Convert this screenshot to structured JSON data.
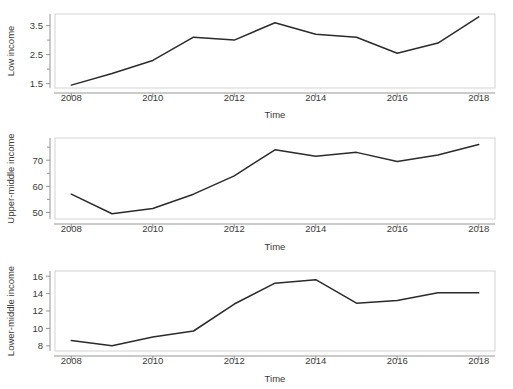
{
  "figure": {
    "width": 513,
    "height": 389,
    "background": "#ffffff",
    "line_color": "#2b2b2b",
    "axis_color": "#8a8a8a",
    "frame_color": "#c9c9c9",
    "text_color": "#3a3a3a"
  },
  "chart_data": [
    {
      "type": "line",
      "title": "",
      "xlabel": "Time",
      "ylabel": "Low income",
      "x": [
        2008,
        2009,
        2010,
        2011,
        2012,
        2013,
        2014,
        2015,
        2016,
        2017,
        2018
      ],
      "values": [
        1.45,
        1.85,
        2.3,
        3.1,
        3.0,
        3.6,
        3.2,
        3.1,
        2.55,
        2.9,
        3.8
      ],
      "series": [
        {
          "name": "Low income",
          "values": [
            1.45,
            1.85,
            2.3,
            3.1,
            3.0,
            3.6,
            3.2,
            3.1,
            2.55,
            2.9,
            3.8
          ]
        }
      ],
      "xlim": [
        2007.6,
        2018.4
      ],
      "ylim": [
        1.35,
        3.9
      ],
      "xticks": [
        2008,
        2010,
        2012,
        2014,
        2016,
        2018
      ],
      "xtick_labels": [
        "2008",
        "2010",
        "2012",
        "2014",
        "2016",
        "2018"
      ],
      "yticks": [
        1.5,
        2.5,
        3.5
      ],
      "ytick_labels": [
        "1.5",
        "2.5",
        "3.5"
      ],
      "yminor_ticks": [
        2.0,
        3.0
      ],
      "grid": false,
      "legend": false
    },
    {
      "type": "line",
      "title": "",
      "xlabel": "Time",
      "ylabel": "Upper-middle income",
      "x": [
        2008,
        2009,
        2010,
        2011,
        2012,
        2013,
        2014,
        2015,
        2016,
        2017,
        2018
      ],
      "values": [
        57.0,
        49.5,
        51.5,
        57.0,
        64.0,
        74.0,
        71.5,
        73.0,
        69.5,
        72.0,
        76.0
      ],
      "series": [
        {
          "name": "Upper-middle income",
          "values": [
            57.0,
            49.5,
            51.5,
            57.0,
            64.0,
            74.0,
            71.5,
            73.0,
            69.5,
            72.0,
            76.0
          ]
        }
      ],
      "xlim": [
        2007.6,
        2018.4
      ],
      "ylim": [
        47.5,
        78.5
      ],
      "xticks": [
        2008,
        2010,
        2012,
        2014,
        2016,
        2018
      ],
      "xtick_labels": [
        "2008",
        "2010",
        "2012",
        "2014",
        "2016",
        "2018"
      ],
      "yticks": [
        50,
        60,
        70
      ],
      "ytick_labels": [
        "50",
        "60",
        "70"
      ],
      "yminor_ticks": [
        55,
        65,
        75
      ],
      "grid": false,
      "legend": false
    },
    {
      "type": "line",
      "title": "",
      "xlabel": "Time",
      "ylabel": "Lower-middle income",
      "x": [
        2008,
        2009,
        2010,
        2011,
        2012,
        2013,
        2014,
        2015,
        2016,
        2017,
        2018
      ],
      "values": [
        8.6,
        8.0,
        9.0,
        9.7,
        12.8,
        15.2,
        15.6,
        12.9,
        13.2,
        14.1,
        14.1
      ],
      "series": [
        {
          "name": "Lower-middle income",
          "values": [
            8.6,
            8.0,
            9.0,
            9.7,
            12.8,
            15.2,
            15.6,
            12.9,
            13.2,
            14.1,
            14.1
          ]
        }
      ],
      "xlim": [
        2007.6,
        2018.4
      ],
      "ylim": [
        7.4,
        16.6
      ],
      "xticks": [
        2008,
        2010,
        2012,
        2014,
        2016,
        2018
      ],
      "xtick_labels": [
        "2008",
        "2010",
        "2012",
        "2014",
        "2016",
        "2018"
      ],
      "yticks": [
        8,
        10,
        12,
        14,
        16
      ],
      "ytick_labels": [
        "8",
        "10",
        "12",
        "14",
        "16"
      ],
      "yminor_ticks": [],
      "grid": false,
      "legend": false
    }
  ]
}
